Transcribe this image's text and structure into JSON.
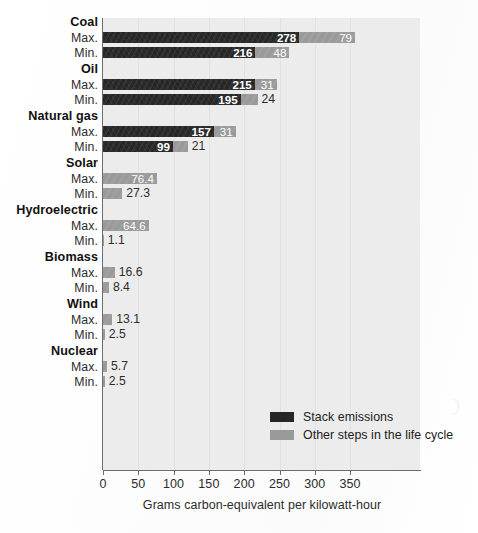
{
  "chart_data": {
    "type": "bar",
    "orientation": "horizontal",
    "stacked": true,
    "title": "",
    "xlabel": "Grams carbon-equivalent per kilowatt-hour",
    "ylabel": "",
    "xlim": [
      0,
      375
    ],
    "xticks": [
      0,
      50,
      100,
      150,
      200,
      250,
      300,
      350
    ],
    "xticklabels": [
      "0",
      "50",
      "100",
      "150",
      "200",
      "250",
      "300",
      "350"
    ],
    "grid": "vertical",
    "legend_position": "inside-bottom-right",
    "series": [
      {
        "name": "Stack emissions",
        "color": "#262626"
      },
      {
        "name": "Other steps in the life cycle",
        "color": "#9a9a9a"
      }
    ],
    "groups": [
      {
        "label": "Coal",
        "rows": [
          {
            "label": "Max.",
            "stack": 278,
            "other": 79,
            "stack_text": "278",
            "other_text": "79"
          },
          {
            "label": "Min.",
            "stack": 216,
            "other": 48,
            "stack_text": "216",
            "other_text": "48"
          }
        ]
      },
      {
        "label": "Oil",
        "rows": [
          {
            "label": "Max.",
            "stack": 215,
            "other": 31,
            "stack_text": "215",
            "other_text": "31"
          },
          {
            "label": "Min.",
            "stack": 195,
            "other": 24,
            "stack_text": "195",
            "other_text": "24"
          }
        ]
      },
      {
        "label": "Natural gas",
        "rows": [
          {
            "label": "Max.",
            "stack": 157,
            "other": 31,
            "stack_text": "157",
            "other_text": "31"
          },
          {
            "label": "Min.",
            "stack": 99,
            "other": 21,
            "stack_text": "99",
            "other_text": "21"
          }
        ]
      },
      {
        "label": "Solar",
        "rows": [
          {
            "label": "Max.",
            "stack": 0,
            "other": 76.4,
            "stack_text": "",
            "other_text": "76.4"
          },
          {
            "label": "Min.",
            "stack": 0,
            "other": 27.3,
            "stack_text": "",
            "other_text": "27.3"
          }
        ]
      },
      {
        "label": "Hydroelectric",
        "rows": [
          {
            "label": "Max.",
            "stack": 0,
            "other": 64.6,
            "stack_text": "",
            "other_text": "64.6"
          },
          {
            "label": "Min.",
            "stack": 0,
            "other": 1.1,
            "stack_text": "",
            "other_text": "1.1"
          }
        ]
      },
      {
        "label": "Biomass",
        "rows": [
          {
            "label": "Max.",
            "stack": 0,
            "other": 16.6,
            "stack_text": "",
            "other_text": "16.6"
          },
          {
            "label": "Min.",
            "stack": 0,
            "other": 8.4,
            "stack_text": "",
            "other_text": "8.4"
          }
        ]
      },
      {
        "label": "Wind",
        "rows": [
          {
            "label": "Max.",
            "stack": 0,
            "other": 13.1,
            "stack_text": "",
            "other_text": "13.1"
          },
          {
            "label": "Min.",
            "stack": 0,
            "other": 2.5,
            "stack_text": "",
            "other_text": "2.5"
          }
        ]
      },
      {
        "label": "Nuclear",
        "rows": [
          {
            "label": "Max.",
            "stack": 0,
            "other": 5.7,
            "stack_text": "",
            "other_text": "5.7"
          },
          {
            "label": "Min.",
            "stack": 0,
            "other": 2.5,
            "stack_text": "",
            "other_text": "2.5"
          }
        ]
      }
    ]
  },
  "legend": {
    "items": [
      {
        "label": "Stack emissions",
        "swatch": "dark"
      },
      {
        "label": "Other steps in the life cycle",
        "swatch": "light"
      }
    ]
  },
  "colors": {
    "stack": "#262626",
    "other": "#9a9a9a",
    "plot_background": "#ececec",
    "gridline": "#e1e1e1",
    "axis": "#6d6d6d",
    "page_background": "#ffffff"
  },
  "geometry": {
    "plot_left": 103,
    "plot_top": 18,
    "plot_width": 317,
    "plot_height": 452,
    "px_per_unit": 0.706,
    "bar_height": 11,
    "row_gap": 4,
    "group_gap": 17,
    "first_row_top": 32
  }
}
